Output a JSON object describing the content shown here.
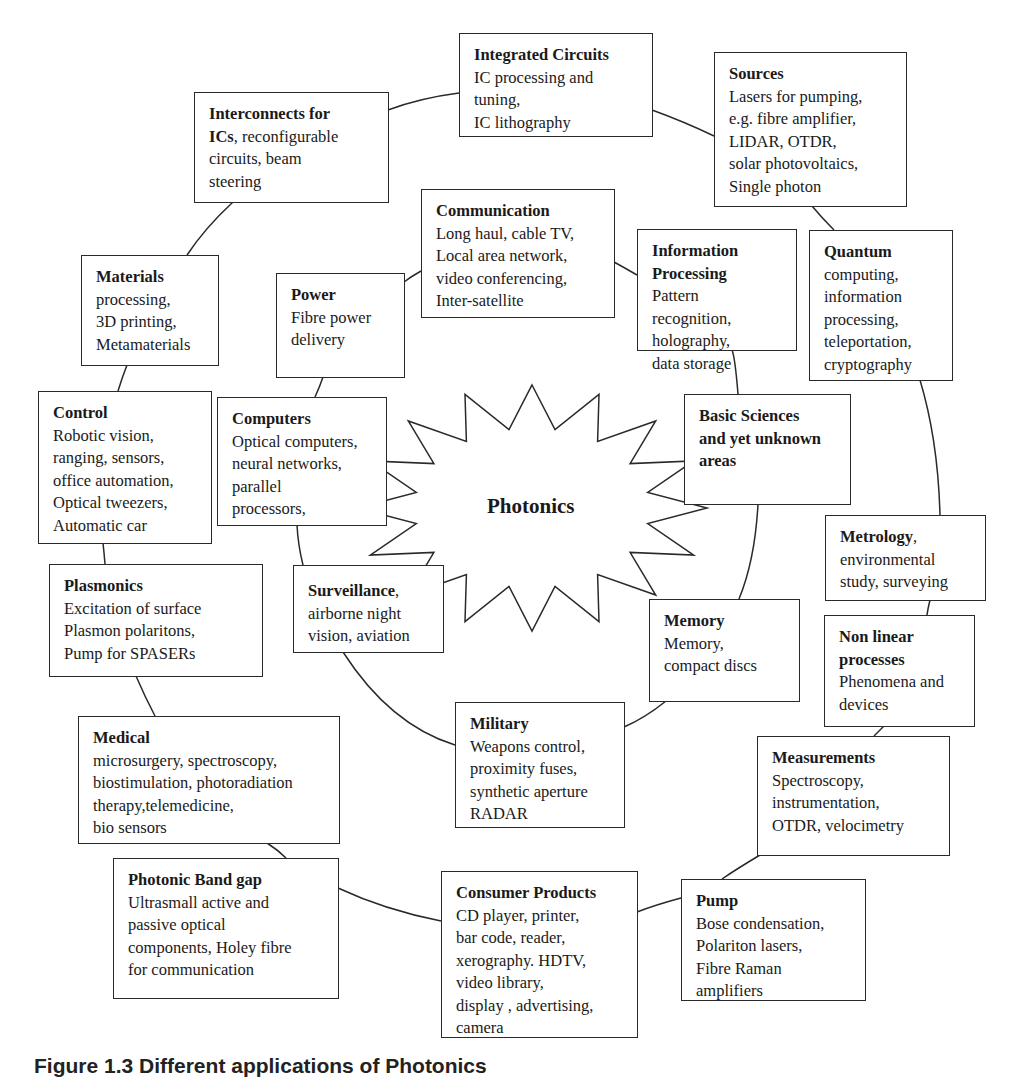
{
  "diagram": {
    "center": "Photonics",
    "caption": "Figure 1.3 Different applications of Photonics",
    "colors": {
      "line": "#2a2a2a",
      "background": "#ffffff",
      "text": "#1a1a1a"
    },
    "nodes": {
      "integrated_circuits": {
        "title": "Integrated Circuits",
        "lines": [
          "IC processing and",
          "tuning,",
          "IC lithography"
        ]
      },
      "sources": {
        "title": "Sources",
        "lines": [
          "Lasers for pumping,",
          "e.g. fibre amplifier,",
          "LIDAR, OTDR,",
          "solar photovoltaics,",
          "Single photon"
        ]
      },
      "interconnects": {
        "title": "Interconnects for",
        "title2": "ICs",
        "title2_suffix": ", reconfigurable",
        "lines": [
          "circuits, beam",
          "steering"
        ]
      },
      "communication": {
        "title": "Communication",
        "lines": [
          "Long haul, cable TV,",
          "Local area network,",
          "video conferencing,",
          "Inter-satellite"
        ]
      },
      "information_processing": {
        "title": "Information",
        "title2": "Processing",
        "lines": [
          "Pattern",
          "recognition,",
          "holography,",
          "data storage"
        ]
      },
      "quantum": {
        "title": "Quantum",
        "lines": [
          "computing,",
          "information",
          "processing,",
          "teleportation,",
          "cryptography"
        ]
      },
      "materials": {
        "title": "Materials",
        "lines": [
          "processing,",
          "3D printing,",
          "Metamaterials"
        ]
      },
      "power": {
        "title": "Power",
        "lines": [
          "Fibre power",
          "delivery"
        ]
      },
      "control": {
        "title": "Control",
        "lines": [
          "Robotic vision,",
          "ranging, sensors,",
          "office automation,",
          "Optical tweezers,",
          "Automatic car"
        ]
      },
      "computers": {
        "title": "Computers",
        "lines": [
          "Optical computers,",
          "neural networks,",
          "parallel",
          "processors,"
        ]
      },
      "basic_sciences": {
        "title": "Basic Sciences",
        "title2": "and yet unknown",
        "title3": "areas"
      },
      "metrology": {
        "title": "Metrology",
        "title_suffix": ",",
        "lines": [
          "environmental",
          "study, surveying"
        ]
      },
      "plasmonics": {
        "title": "Plasmonics",
        "lines": [
          "Excitation of surface",
          "Plasmon polaritons,",
          "Pump for SPASERs"
        ]
      },
      "surveillance": {
        "title": "Surveillance",
        "title_suffix": ",",
        "lines": [
          "airborne night",
          "vision, aviation"
        ]
      },
      "memory": {
        "title": "Memory",
        "lines": [
          "Memory,",
          "compact discs"
        ]
      },
      "non_linear": {
        "title": "Non linear",
        "title2": "processes",
        "lines": [
          "Phenomena and",
          "devices"
        ]
      },
      "military": {
        "title": "Military",
        "lines": [
          "Weapons control,",
          "proximity fuses,",
          "synthetic aperture",
          "RADAR"
        ]
      },
      "medical": {
        "title": "Medical",
        "lines": [
          "microsurgery, spectroscopy,",
          "biostimulation, photoradiation",
          "therapy,telemedicine,",
          "bio sensors"
        ]
      },
      "measurements": {
        "title": "Measurements",
        "lines": [
          "Spectroscopy,",
          "instrumentation,",
          "OTDR, velocimetry"
        ]
      },
      "photonic_band_gap": {
        "title": "Photonic Band gap",
        "lines": [
          "Ultrasmall active and",
          "passive optical",
          "components, Holey fibre",
          "for communication"
        ]
      },
      "consumer_products": {
        "title": "Consumer Products",
        "lines": [
          "CD player, printer,",
          "bar code, reader,",
          "xerography. HDTV,",
          "video library,",
          "display , advertising,",
          "camera"
        ]
      },
      "pump": {
        "title": "Pump",
        "lines": [
          "Bose condensation,",
          "Polariton lasers,",
          "Fibre Raman",
          "amplifiers"
        ]
      }
    }
  }
}
